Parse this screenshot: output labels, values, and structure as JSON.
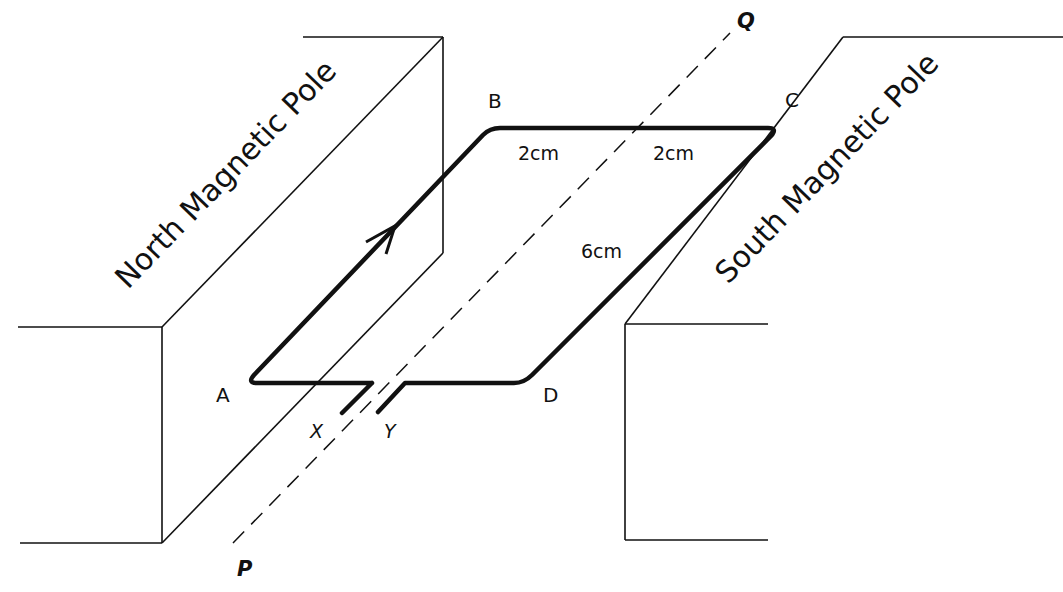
{
  "diagram": {
    "poles": {
      "north": "North Magnetic Pole",
      "south": "South Magnetic Pole"
    },
    "corners": {
      "a": "A",
      "b": "B",
      "c": "C",
      "d": "D"
    },
    "terminals": {
      "x": "X",
      "y": "Y"
    },
    "axis": {
      "p": "P",
      "q": "Q"
    },
    "dimensions": {
      "bc_left": "2cm",
      "bc_right": "2cm",
      "cd": "6cm"
    },
    "colors": {
      "stroke": "#111111",
      "background": "#ffffff"
    }
  }
}
